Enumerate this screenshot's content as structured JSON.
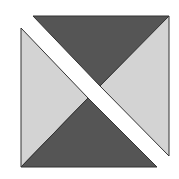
{
  "diagram": {
    "title": "",
    "colors": {
      "background": "#ffffff",
      "dark_fill": "#555555",
      "light_fill": "#d3d3d3",
      "stroke": "#333333"
    },
    "pieces": [
      {
        "name": "upper-right-dark-triangle",
        "fill": "dark",
        "points": "33,16 169,16 100,86"
      },
      {
        "name": "upper-right-light-triangle",
        "fill": "light",
        "points": "169,16 169,156 100,86"
      },
      {
        "name": "lower-left-light-triangle",
        "fill": "light",
        "points": "21,28 21,167 88,98"
      },
      {
        "name": "lower-left-dark-triangle",
        "fill": "dark",
        "points": "21,167 157,167 88,98"
      }
    ]
  }
}
